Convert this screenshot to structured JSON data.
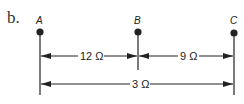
{
  "figure": {
    "part_label": "b.",
    "nodes": [
      {
        "id": "A",
        "label": "A"
      },
      {
        "id": "B",
        "label": "B"
      },
      {
        "id": "C",
        "label": "C"
      }
    ],
    "dimensions": [
      {
        "from": "A",
        "to": "B",
        "label": "12 Ω"
      },
      {
        "from": "B",
        "to": "C",
        "label": "9 Ω"
      },
      {
        "from": "A",
        "to": "C",
        "label": "3 Ω"
      }
    ]
  }
}
